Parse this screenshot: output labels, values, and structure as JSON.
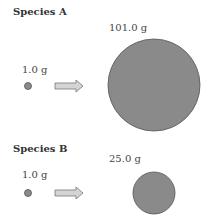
{
  "panels": [
    {
      "title": "Species A",
      "initial_mass_label": "1.0 g",
      "final_mass_label": "101.0 g",
      "initial_mass_g": 1.0,
      "final_mass_g": 101.0
    },
    {
      "title": "Species B",
      "initial_mass_label": "1.0 g",
      "final_mass_label": "25.0 g",
      "initial_mass_g": 1.0,
      "final_mass_g": 25.0
    }
  ],
  "colors": {
    "circle_fill": "#8a8a8a",
    "circle_stroke": "#555555",
    "arrow_fill": "#d4d4d4",
    "arrow_stroke": "#777777"
  }
}
